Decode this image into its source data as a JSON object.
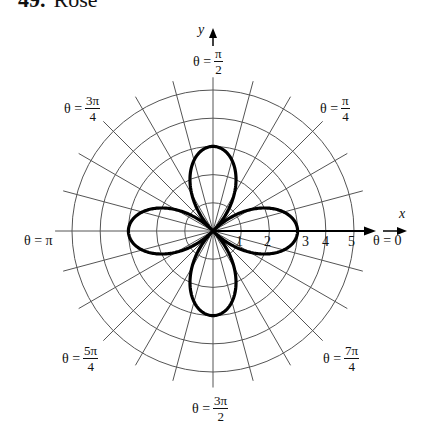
{
  "title": {
    "number": "49.",
    "text": "Rose"
  },
  "chart_data": {
    "type": "polar_line",
    "equation_implied": "r = 3cos(2θ)",
    "series": [
      {
        "name": "rose",
        "petals": 4,
        "amplitude": 3,
        "k": 2,
        "function": "cos",
        "petal_directions": [
          "θ = 0",
          "θ = π/2",
          "θ = π",
          "θ = 3π/2"
        ]
      }
    ],
    "radial_ticks": [
      1,
      2,
      3,
      4,
      5
    ],
    "rmax": 5,
    "radial_grid_step_deg": 15,
    "angle_labels": [
      {
        "theta": "0",
        "text": "θ = 0"
      },
      {
        "theta": "π/4",
        "text": "θ = π/4"
      },
      {
        "theta": "π/2",
        "text": "θ = π/2"
      },
      {
        "theta": "3π/4",
        "text": "θ = 3π/4"
      },
      {
        "theta": "π",
        "text": "θ = π"
      },
      {
        "theta": "5π/4",
        "text": "θ = 5π/4"
      },
      {
        "theta": "3π/2",
        "text": "θ = 3π/2"
      },
      {
        "theta": "7π/4",
        "text": "θ = 7π/4"
      }
    ],
    "xlabel": "x",
    "ylabel": "y",
    "grid": true
  },
  "labels": {
    "theta_prefix": "θ =",
    "t0": "0",
    "pi": "π",
    "pi_over_4": {
      "n": "π",
      "d": "4"
    },
    "pi_over_2": {
      "n": "π",
      "d": "2"
    },
    "three_pi_over_4": {
      "n": "3π",
      "d": "4"
    },
    "five_pi_over_4": {
      "n": "5π",
      "d": "4"
    },
    "three_pi_over_2": {
      "n": "3π",
      "d": "2"
    },
    "seven_pi_over_4": {
      "n": "7π",
      "d": "4"
    },
    "x_axis": "x",
    "y_axis": "y",
    "ticks": [
      "1",
      "2",
      "3",
      "4",
      "5"
    ]
  },
  "style": {
    "curve_color": "#000000",
    "grid_color": "#555555"
  }
}
